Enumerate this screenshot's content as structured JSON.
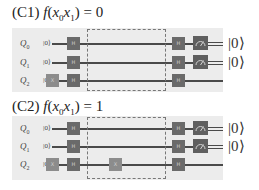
{
  "panels": [
    {
      "id": "C1",
      "label": "(C1)",
      "function": "f",
      "arg_open": "(",
      "x0": "x",
      "x0_sub": "0",
      "x1": "x",
      "x1_sub": "1",
      "arg_close": ")",
      "equals": " = ",
      "value": "0",
      "qubits": [
        {
          "name": "Q",
          "sub": "0",
          "init": "|0⟩",
          "pre_gates": [
            "H"
          ],
          "oracle_gates": [],
          "post_gates": [
            "H"
          ],
          "measured": true
        },
        {
          "name": "Q",
          "sub": "1",
          "init": "|0⟩",
          "pre_gates": [
            "H"
          ],
          "oracle_gates": [],
          "post_gates": [
            "H"
          ],
          "measured": true
        },
        {
          "name": "Q",
          "sub": "2",
          "init": "|0⟩",
          "pre_gates": [
            "X",
            "H"
          ],
          "oracle_gates": [],
          "post_gates": [
            "H"
          ],
          "measured": false
        }
      ],
      "outputs": [
        "|0⟩",
        "|0⟩"
      ]
    },
    {
      "id": "C2",
      "label": "(C2)",
      "function": "f",
      "arg_open": "(",
      "x0": "x",
      "x0_sub": "0",
      "x1": "x",
      "x1_sub": "1",
      "arg_close": ")",
      "equals": " = ",
      "value": "1",
      "qubits": [
        {
          "name": "Q",
          "sub": "0",
          "init": "|0⟩",
          "pre_gates": [
            "H"
          ],
          "oracle_gates": [],
          "post_gates": [
            "H"
          ],
          "measured": true
        },
        {
          "name": "Q",
          "sub": "1",
          "init": "|0⟩",
          "pre_gates": [
            "H"
          ],
          "oracle_gates": [],
          "post_gates": [
            "H"
          ],
          "measured": true
        },
        {
          "name": "Q",
          "sub": "2",
          "init": "|0⟩",
          "pre_gates": [
            "X",
            "H"
          ],
          "oracle_gates": [
            "X"
          ],
          "post_gates": [
            "H"
          ],
          "measured": false
        }
      ],
      "outputs": [
        "|0⟩",
        "|0⟩"
      ]
    }
  ],
  "gate_labels": {
    "H": "H",
    "X": "X"
  },
  "colors": {
    "panel_bg": "#ececec",
    "gate_h": "#6a6a6a",
    "gate_x": "#8c8c8c",
    "measure": "#5f5f5f",
    "wire": "#4a4a4a"
  }
}
